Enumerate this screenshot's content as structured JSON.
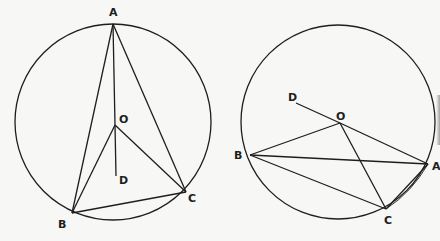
{
  "figures": [
    {
      "id": "left",
      "circle": {
        "cx": 113,
        "cy": 122,
        "r": 98
      },
      "points": {
        "A": {
          "x": 113,
          "y": 24,
          "label": "A",
          "lx": 109,
          "ly": 16
        },
        "O": {
          "x": 115,
          "y": 125,
          "label": "O",
          "lx": 119,
          "ly": 123
        },
        "D": {
          "x": 116,
          "y": 176,
          "label": "D",
          "lx": 119,
          "ly": 184
        },
        "B": {
          "x": 72,
          "y": 213,
          "label": "B",
          "lx": 58,
          "ly": 228
        },
        "C": {
          "x": 186,
          "y": 192,
          "label": "C",
          "lx": 188,
          "ly": 202
        }
      },
      "segments": [
        [
          "A",
          "B"
        ],
        [
          "A",
          "C"
        ],
        [
          "A",
          "O"
        ],
        [
          "O",
          "D"
        ],
        [
          "O",
          "B"
        ],
        [
          "O",
          "C"
        ],
        [
          "B",
          "C"
        ]
      ]
    },
    {
      "id": "right",
      "circle": {
        "cx": 338,
        "cy": 122,
        "r": 97
      },
      "points": {
        "D": {
          "x": 296,
          "y": 103,
          "label": "D",
          "lx": 288,
          "ly": 101
        },
        "O": {
          "x": 340,
          "y": 123,
          "label": "O",
          "lx": 336,
          "ly": 120
        },
        "B": {
          "x": 250,
          "y": 155,
          "label": "B",
          "lx": 234,
          "ly": 159
        },
        "A": {
          "x": 428,
          "y": 164,
          "label": "A",
          "lx": 432,
          "ly": 170
        },
        "C": {
          "x": 386,
          "y": 209,
          "label": "C",
          "lx": 384,
          "ly": 224
        }
      },
      "segments": [
        [
          "D",
          "O"
        ],
        [
          "O",
          "A"
        ],
        [
          "O",
          "B"
        ],
        [
          "O",
          "C"
        ],
        [
          "B",
          "A"
        ],
        [
          "B",
          "C"
        ],
        [
          "C",
          "A"
        ]
      ]
    }
  ],
  "labels": {
    "left": {
      "A": "A",
      "O": "O",
      "D": "D",
      "B": "B",
      "C": "C"
    },
    "right": {
      "A": "A",
      "O": "O",
      "D": "D",
      "B": "B",
      "C": "C"
    }
  }
}
